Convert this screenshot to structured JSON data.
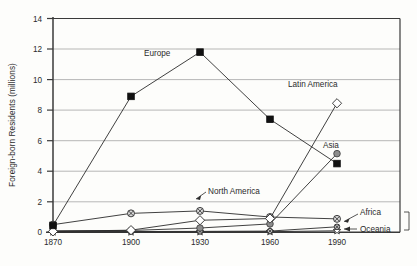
{
  "chart_data": {
    "type": "line",
    "title": "",
    "xlabel": "",
    "ylabel": "Foreign-born Residents (millions)",
    "categories": [
      "1870",
      "1900",
      "1930",
      "1960",
      "1990"
    ],
    "x": [
      1870,
      1900,
      1930,
      1960,
      1990
    ],
    "xlim": [
      1870,
      1990
    ],
    "ylim": [
      0,
      14
    ],
    "yticks": [
      "0",
      "2",
      "4",
      "6",
      "8",
      "10",
      "12",
      "14"
    ],
    "ytick_values": [
      0,
      2,
      4,
      6,
      8,
      10,
      12,
      14
    ],
    "grid": "horizontal",
    "legend_position": "inline-labels",
    "series": [
      {
        "name": "Europe",
        "marker": "filled-square",
        "marker_color": "#111111",
        "values": [
          0.45,
          8.9,
          11.8,
          7.4,
          4.5
        ]
      },
      {
        "name": "Latin America",
        "marker": "open-diamond",
        "marker_color": "#ffffff",
        "values": [
          0.06,
          0.14,
          0.79,
          0.9,
          8.45
        ]
      },
      {
        "name": "Asia",
        "marker": "filled-circle",
        "marker_color": "#8c8c8c",
        "values": [
          0.1,
          0.12,
          0.28,
          0.55,
          5.15
        ]
      },
      {
        "name": "North America",
        "marker": "crossed-circle",
        "marker_color": "#d9d9d9",
        "values": [
          0.5,
          1.24,
          1.4,
          1.0,
          0.88
        ]
      },
      {
        "name": "Africa",
        "marker": "crossed-circle-small",
        "marker_color": "#bdbdbd",
        "values": [
          0.04,
          0.05,
          0.06,
          0.08,
          0.36
        ]
      },
      {
        "name": "Oceania",
        "marker": "open-star",
        "marker_color": "#ffffff",
        "values": [
          0.02,
          0.02,
          0.03,
          0.04,
          0.1
        ]
      }
    ]
  },
  "labels": {
    "europe": "Europe",
    "latin_america": "Latin America",
    "asia": "Asia",
    "north_america": "North America",
    "africa": "Africa",
    "oceania": "Oceania"
  },
  "axis": {
    "y_title": "Foreign-born Residents (millions)",
    "y_ticks": [
      "14",
      "12",
      "10",
      "8",
      "6",
      "4",
      "2",
      "0"
    ],
    "x_ticks": [
      "1870",
      "1900",
      "1930",
      "1960",
      "1990"
    ]
  }
}
